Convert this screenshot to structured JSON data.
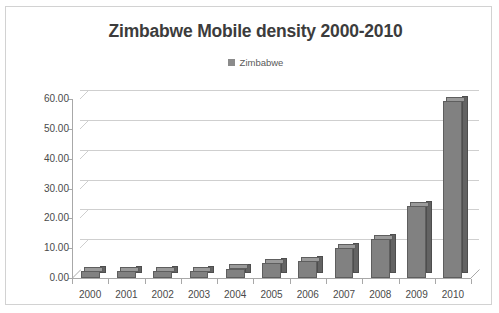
{
  "chart_data": {
    "type": "bar",
    "title": "Zimbabwe Mobile density 2000-2010",
    "xlabel": "",
    "ylabel": "",
    "categories": [
      "2000",
      "2001",
      "2002",
      "2003",
      "2004",
      "2005",
      "2006",
      "2007",
      "2008",
      "2009",
      "2010"
    ],
    "values": [
      2.2,
      2.3,
      2.4,
      2.5,
      3.2,
      5.0,
      5.6,
      10.2,
      13.0,
      24.0,
      59.5
    ],
    "series": [
      {
        "name": "Zimbabwe",
        "values": [
          2.2,
          2.3,
          2.4,
          2.5,
          3.2,
          5.0,
          5.6,
          10.2,
          13.0,
          24.0,
          59.5
        ]
      }
    ],
    "ylim": [
      0,
      60
    ],
    "ytick_step": 10,
    "ytick_labels": [
      "0.00",
      "10.00",
      "20.00",
      "30.00",
      "40.00",
      "50.00",
      "60.00"
    ],
    "ytick_values": [
      0,
      10,
      20,
      30,
      40,
      50,
      60
    ],
    "grid": true,
    "legend_position": "top",
    "three_d": true,
    "bar_color": "#818181",
    "bar_side_color": "#636363",
    "bar_top_color": "#9a9a9a",
    "grid_color": "#cfcfcf",
    "axis_color": "#a8a8a8",
    "title_color": "#3c3c3c",
    "plot_background": "#ffffff"
  },
  "legend": {
    "label": "Zimbabwe",
    "swatch_color": "#8b8b8b"
  },
  "frame": {
    "border_color": "#d2d2d2"
  }
}
